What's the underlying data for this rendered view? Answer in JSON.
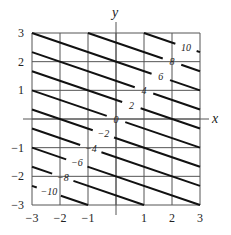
{
  "chart_data": {
    "type": "contour",
    "title": "",
    "function": "f(x, y) = x + 3y",
    "xlabel": "x",
    "ylabel": "y",
    "xlim": [
      -3,
      3
    ],
    "ylim": [
      -3,
      3
    ],
    "xticks": [
      -3,
      -2,
      -1,
      1,
      2,
      3
    ],
    "yticks": [
      -3,
      -2,
      -1,
      1,
      2,
      3
    ],
    "xtick_labels": [
      "−3",
      "−2",
      "−1",
      "1",
      "2",
      "3"
    ],
    "ytick_labels": [
      "−3",
      "−2",
      "−1",
      "1",
      "2",
      "3"
    ],
    "grid": true,
    "legend": null,
    "levels": [
      -12,
      -10,
      -8,
      -6,
      -4,
      -2,
      0,
      2,
      4,
      6,
      8,
      10,
      12
    ],
    "labeled_levels": [
      {
        "value": 10,
        "label": "10",
        "x": 2.5,
        "y": 2.5
      },
      {
        "value": 8,
        "label": "8",
        "x": 2.0,
        "y": 2.0
      },
      {
        "value": 6,
        "label": "6",
        "x": 1.6,
        "y": 1.47
      },
      {
        "value": 4,
        "label": "4",
        "x": 1.0,
        "y": 1.0
      },
      {
        "value": 2,
        "label": "2",
        "x": 0.55,
        "y": 0.48
      },
      {
        "value": 0,
        "label": "0",
        "x": 0.0,
        "y": 0.0
      },
      {
        "value": -2,
        "label": "−2",
        "x": -0.45,
        "y": -0.52
      },
      {
        "value": -4,
        "label": "−4",
        "x": -0.9,
        "y": -1.03
      },
      {
        "value": -6,
        "label": "−6",
        "x": -1.4,
        "y": -1.53
      },
      {
        "value": -8,
        "label": "−8",
        "x": -1.9,
        "y": -2.03
      },
      {
        "value": -10,
        "label": "−10",
        "x": -2.4,
        "y": -2.53
      }
    ]
  }
}
